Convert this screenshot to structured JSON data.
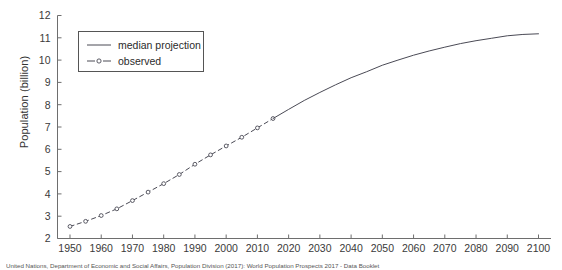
{
  "figure": {
    "background_color": "#ffffff",
    "line_color": "#4a4a55",
    "axis_color": "#6e6e6e",
    "text_color": "#2b2b2b"
  },
  "axes": {
    "y_title": "Population (billion)",
    "x_title": "",
    "y_ticks": [
      "2",
      "3",
      "4",
      "5",
      "6",
      "7",
      "8",
      "9",
      "10",
      "11",
      "12"
    ],
    "x_ticks": [
      "1950",
      "1960",
      "1970",
      "1980",
      "1990",
      "2000",
      "2010",
      "2020",
      "2030",
      "2040",
      "2050",
      "2060",
      "2070",
      "2080",
      "2090",
      "2100"
    ]
  },
  "legend": {
    "position": "top-left",
    "entries": [
      {
        "label": "median projection",
        "style": "solid",
        "marker": "none"
      },
      {
        "label": "observed",
        "style": "dashed",
        "marker": "open-circle"
      }
    ]
  },
  "caption": {
    "text": "United Nations, Department of Economic and Social Affairs, Population Division (2017): World Population Prospects 2017 - Data Booklet"
  },
  "chart_data": {
    "type": "line",
    "title": "",
    "xlabel": "",
    "ylabel": "Population (billion)",
    "xlim": [
      1946,
      2104
    ],
    "ylim": [
      2,
      12
    ],
    "grid": false,
    "legend_position": "top-left",
    "x_ticks": [
      1950,
      1960,
      1970,
      1980,
      1990,
      2000,
      2010,
      2020,
      2030,
      2040,
      2050,
      2060,
      2070,
      2080,
      2090,
      2100
    ],
    "y_ticks": [
      2,
      3,
      4,
      5,
      6,
      7,
      8,
      9,
      10,
      11,
      12
    ],
    "series": [
      {
        "name": "observed",
        "style": "dashed",
        "marker": "open-circle",
        "x": [
          1950,
          1955,
          1960,
          1965,
          1970,
          1975,
          1980,
          1985,
          1990,
          1995,
          2000,
          2005,
          2010,
          2015
        ],
        "values": [
          2.54,
          2.77,
          3.03,
          3.33,
          3.7,
          4.08,
          4.46,
          4.87,
          5.33,
          5.75,
          6.15,
          6.54,
          6.96,
          7.38
        ]
      },
      {
        "name": "median projection",
        "style": "solid",
        "marker": "none",
        "x": [
          2015,
          2020,
          2025,
          2030,
          2035,
          2040,
          2045,
          2050,
          2055,
          2060,
          2065,
          2070,
          2075,
          2080,
          2085,
          2090,
          2095,
          2100
        ],
        "values": [
          7.38,
          7.79,
          8.19,
          8.55,
          8.89,
          9.21,
          9.48,
          9.77,
          10.0,
          10.22,
          10.41,
          10.58,
          10.74,
          10.87,
          10.98,
          11.09,
          11.15,
          11.18
        ]
      }
    ]
  }
}
